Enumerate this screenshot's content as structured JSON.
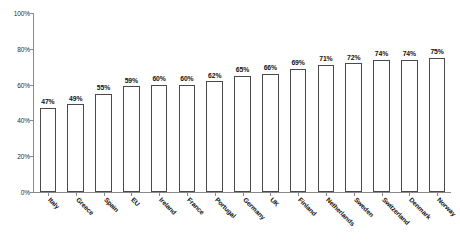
{
  "chart_data": {
    "type": "bar",
    "title": "",
    "subtitle": "",
    "xlabel": "",
    "ylabel": "",
    "ylim": [
      0,
      100
    ],
    "y_ticks": [
      0,
      20,
      40,
      60,
      80,
      100
    ],
    "y_tick_labels": [
      "0%",
      "20%",
      "40%",
      "60%",
      "80%",
      "100%"
    ],
    "grid": false,
    "legend": null,
    "legend_position": "none",
    "value_label_suffix": "%",
    "categories": [
      "Italy",
      "Greece",
      "Spain",
      "EU",
      "Ireland",
      "France",
      "Portugal",
      "Germany",
      "UK",
      "Finland",
      "Netherlands",
      "Sweden",
      "Switzerland",
      "Denmark",
      "Norway"
    ],
    "values": [
      47,
      49,
      55,
      59,
      60,
      60,
      62,
      65,
      66,
      69,
      71,
      72,
      74,
      74,
      75
    ],
    "value_labels": [
      "47%",
      "49%",
      "55%",
      "59%",
      "60%",
      "60%",
      "62%",
      "65%",
      "66%",
      "69%",
      "71%",
      "72%",
      "74%",
      "74%",
      "75%"
    ],
    "colors": {
      "bar_fill": "#ffffff",
      "bar_stroke": "#4a4a4a",
      "axis": "#8a8a8a",
      "text": "#111111",
      "background": "#ffffff"
    }
  }
}
